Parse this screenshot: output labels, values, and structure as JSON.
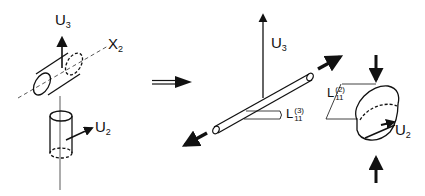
{
  "figure": {
    "left_panel": {
      "horizontal_cylinder": {
        "axis_label": "X",
        "axis_subscript": "2",
        "arrow_label": "U",
        "arrow_subscript": "3"
      },
      "vertical_cylinder": {
        "arrow_label": "U",
        "arrow_subscript": "2"
      }
    },
    "transition_arrow": "implies-double-arrow",
    "right_panel": {
      "rod": {
        "arrow_label": "U",
        "arrow_subscript": "3",
        "dimension_label": "L",
        "dimension_superscript": "(3)",
        "dimension_subscript": "11"
      },
      "disc": {
        "dimension_label": "L",
        "dimension_superscript": "(2)",
        "dimension_subscript": "11",
        "arrow_label": "U",
        "arrow_subscript": "2"
      }
    },
    "colors": {
      "ink": "#111111",
      "background": "#ffffff"
    }
  }
}
